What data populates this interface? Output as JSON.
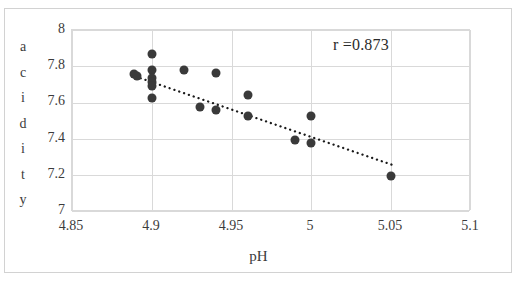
{
  "chart_data": {
    "type": "scatter",
    "title": "",
    "xlabel": "pH",
    "ylabel": "acidity",
    "ylabel_letters": [
      "a",
      "c",
      "i",
      "d",
      "i",
      "t",
      "y"
    ],
    "xlim": [
      4.85,
      5.1
    ],
    "ylim": [
      7,
      8
    ],
    "xticks": [
      "4.85",
      "4.9",
      "4.95",
      "5",
      "5.05",
      "5.1"
    ],
    "xtick_values": [
      4.85,
      4.9,
      4.95,
      5.0,
      5.05,
      5.1
    ],
    "yticks": [
      "7",
      "7.2",
      "7.4",
      "7.6",
      "7.8",
      "8"
    ],
    "ytick_values": [
      7,
      7.2,
      7.4,
      7.6,
      7.8,
      8
    ],
    "grid": "both",
    "legend": "none",
    "annotations": [
      {
        "name": "correlation",
        "text": "r =0.873",
        "value": 0.873
      }
    ],
    "marker_color": "#3a3a3a",
    "gridline_color": "#d9d9d9",
    "trendline": {
      "style": "dotted",
      "color": "#1a1a1a",
      "x_start": 4.893,
      "y_start": 7.735,
      "x_end": 5.052,
      "y_end": 7.255
    },
    "points": [
      {
        "x": 4.889,
        "y": 7.757
      },
      {
        "x": 4.891,
        "y": 7.745
      },
      {
        "x": 4.9,
        "y": 7.868
      },
      {
        "x": 4.9,
        "y": 7.782
      },
      {
        "x": 4.9,
        "y": 7.735
      },
      {
        "x": 4.9,
        "y": 7.712
      },
      {
        "x": 4.9,
        "y": 7.693
      },
      {
        "x": 4.9,
        "y": 7.625
      },
      {
        "x": 4.92,
        "y": 7.778
      },
      {
        "x": 4.93,
        "y": 7.578
      },
      {
        "x": 4.94,
        "y": 7.762
      },
      {
        "x": 4.94,
        "y": 7.558
      },
      {
        "x": 4.96,
        "y": 7.645
      },
      {
        "x": 4.96,
        "y": 7.528
      },
      {
        "x": 4.99,
        "y": 7.397
      },
      {
        "x": 5.0,
        "y": 7.525
      },
      {
        "x": 5.0,
        "y": 7.378
      },
      {
        "x": 5.05,
        "y": 7.197
      }
    ]
  }
}
